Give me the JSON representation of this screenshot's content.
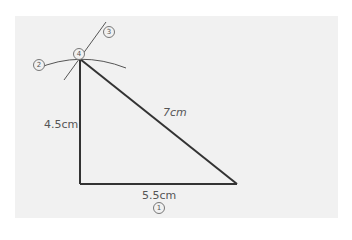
{
  "diagram": {
    "sides": {
      "base": "5.5cm",
      "left": "4.5cm",
      "hypotenuse": "7cm"
    },
    "steps": {
      "s1": "1",
      "s2": "2",
      "s3": "3",
      "s4": "4"
    },
    "colors": {
      "background": "#f1f1f1",
      "line": "#333333",
      "thin_line": "#555555"
    }
  }
}
